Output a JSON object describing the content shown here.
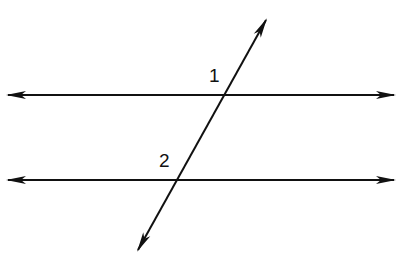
{
  "diagram": {
    "type": "parallel lines cut by a transversal",
    "line_color": "#111111",
    "background": "#ffffff",
    "lines": [
      {
        "name": "parallel-line-top",
        "x1": 6,
        "y1": 95,
        "x2": 396,
        "y2": 95
      },
      {
        "name": "parallel-line-bottom",
        "x1": 6,
        "y1": 180,
        "x2": 396,
        "y2": 180
      },
      {
        "name": "transversal",
        "x1": 267,
        "y1": 18,
        "x2": 137,
        "y2": 252
      }
    ],
    "angle_labels": [
      {
        "text": "1",
        "x": 209,
        "y": 82
      },
      {
        "text": "2",
        "x": 159,
        "y": 167
      }
    ]
  }
}
